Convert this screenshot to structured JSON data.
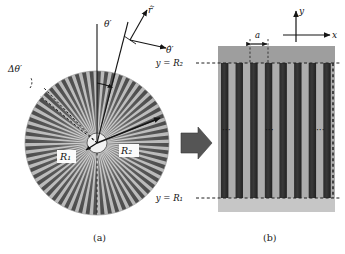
{
  "figure": {
    "type": "schematic-diagram",
    "panels": [
      {
        "id": "a",
        "caption": "(a)",
        "description": "radial-spoke annulus in polar coordinates",
        "labels": {
          "theta_prime": "θ′",
          "delta_theta_prime": "Δθ′",
          "r_hat_prime": "r̂′",
          "theta_hat_prime": "θ̂′",
          "R1": "R₁",
          "R2": "R₂"
        },
        "geometry": {
          "center_x": 97,
          "center_y": 143,
          "outer_radius": 72,
          "inner_radius": 10,
          "spoke_count": 60
        }
      },
      {
        "id": "b",
        "caption": "(b)",
        "description": "unrolled cartesian strip grating",
        "labels": {
          "y_axis": "y",
          "x_axis": "x",
          "period": "a",
          "y_eq_R2": "y = R₂",
          "y_eq_R1": "y = R₁",
          "ellipsis": "···"
        },
        "geometry": {
          "left": 218,
          "right": 335,
          "top": 63,
          "bottom": 198,
          "stripe_count": 8
        }
      }
    ],
    "arrow": {
      "name": "transform-arrow",
      "direction": "right"
    },
    "colors": {
      "stripe_light": "#b9b9b9",
      "stripe_dark": "#3c3c3c",
      "panel_bg": "#adadad",
      "header_band": "#9e9e9e",
      "ink": "#1a1a1a",
      "arrow_fill": "#555555"
    }
  }
}
